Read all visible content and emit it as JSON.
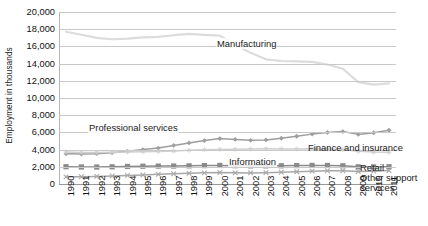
{
  "chart_data": {
    "type": "line",
    "title": "",
    "xlabel": "",
    "ylabel": "Employment in thousands",
    "ylim": [
      0,
      20000
    ],
    "ytick_step": 2000,
    "yticks": [
      "0",
      "2,000",
      "4,000",
      "6,000",
      "8,000",
      "10,000",
      "12,000",
      "14,000",
      "16,000",
      "18,000",
      "20,000"
    ],
    "ytick_values": [
      0,
      2000,
      4000,
      6000,
      8000,
      10000,
      12000,
      14000,
      16000,
      18000,
      20000
    ],
    "grid": true,
    "legend_position": "inline-annotations",
    "categories": [
      "1990",
      "1991",
      "1992",
      "1993",
      "1994",
      "1995",
      "1996",
      "1997",
      "1998",
      "1999",
      "2000",
      "2001",
      "2002",
      "2003",
      "2004",
      "2005",
      "2006",
      "2007",
      "2008",
      "2009",
      "2010",
      "2011"
    ],
    "x": [
      1990,
      1991,
      1992,
      1993,
      1994,
      1995,
      1996,
      1997,
      1998,
      1999,
      2000,
      2001,
      2002,
      2003,
      2004,
      2005,
      2006,
      2007,
      2008,
      2009,
      2010,
      2011
    ],
    "series": [
      {
        "name": "Manufacturing",
        "color": "#dcdcdc",
        "marker": "none",
        "label_x": 1999.1,
        "label_y": 18700,
        "values": [
          17700,
          17350,
          17000,
          16830,
          16900,
          17050,
          17100,
          17300,
          17450,
          17350,
          17250,
          16200,
          15250,
          14500,
          14300,
          14250,
          14200,
          13900,
          13400,
          11850,
          11550,
          11700
        ]
      },
      {
        "name": "Professional services",
        "color": "#9e9e9e",
        "marker": "diamond",
        "label_x": 1993.5,
        "label_y": 7300,
        "values": [
          3520,
          3480,
          3530,
          3630,
          3810,
          4000,
          4180,
          4480,
          4780,
          5050,
          5280,
          5180,
          5080,
          5120,
          5320,
          5550,
          5800,
          6000,
          6100,
          5770,
          5960,
          6250
        ]
      },
      {
        "name": "Finance and insurance",
        "color": "#cfcfcf",
        "marker": "star",
        "label_x": 2005.6,
        "label_y": 5200,
        "values": [
          3720,
          3660,
          3650,
          3700,
          3730,
          3750,
          3790,
          3840,
          3920,
          3980,
          4020,
          4030,
          4060,
          4090,
          4080,
          4070,
          4100,
          4080,
          4000,
          3800,
          3720,
          3690
        ]
      },
      {
        "name": "Retail",
        "color": "#8a8a8a",
        "marker": "square",
        "label_x": 2011.4,
        "label_y": 2500,
        "values": [
          2010,
          1980,
          1970,
          2000,
          2040,
          2070,
          2080,
          2090,
          2110,
          2140,
          2160,
          2130,
          2110,
          2110,
          2120,
          2140,
          2160,
          2160,
          2120,
          2000,
          1990,
          2010
        ]
      },
      {
        "name": "Other support services",
        "color": "#a8a8a8",
        "marker": "x",
        "label_x": 2011.4,
        "label_y": 1550,
        "values": [
          830,
          840,
          880,
          930,
          1000,
          1060,
          1120,
          1190,
          1250,
          1300,
          1340,
          1300,
          1290,
          1320,
          1370,
          1430,
          1490,
          1540,
          1540,
          1450,
          1490,
          1560
        ]
      }
    ],
    "annotations": [
      {
        "text": "Manufacturing",
        "x_px": 216,
        "y_px": 38
      },
      {
        "text": "Professional services",
        "x_px": 88,
        "y_px": 122
      },
      {
        "text": "Information",
        "x_px": 228,
        "y_px": 156
      }
    ],
    "side_labels": [
      {
        "text": "Finance and insurance",
        "x_px": 308,
        "y_px": 142
      },
      {
        "text": "Retail",
        "x_px": 360,
        "y_px": 162
      },
      {
        "text": "Other support",
        "x_px": 360,
        "y_px": 172
      },
      {
        "text": "services",
        "x_px": 360,
        "y_px": 182
      }
    ]
  }
}
